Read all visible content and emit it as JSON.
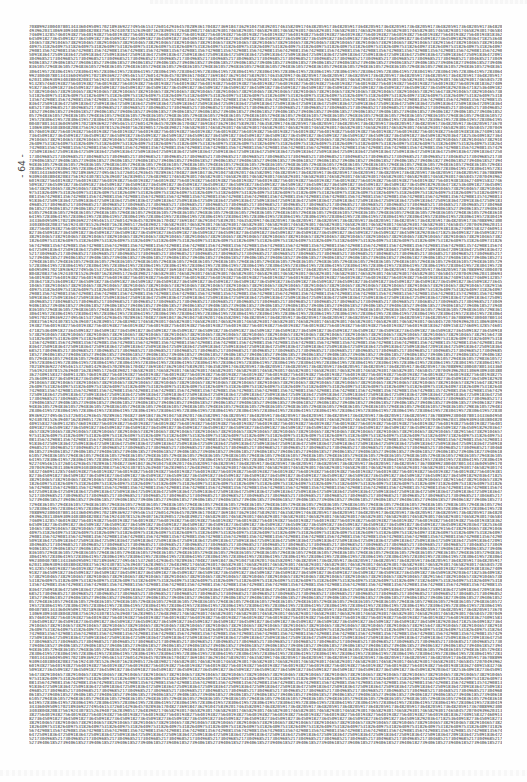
{
  "page": {
    "page_number": "- 64 -",
    "line_count": 178,
    "row_pool": [
      "708899230040780134336049509170218936922749546153726014293645702893617048273691847362910475839201746358209174638205917364820591736482059173648205917364820591736482059173648205917364820591736",
      "457207049396203130693093403804820837561924307815263940716283905172648390217465829301746582930174658293017465829301746582930174658293017465829301746582930174658293017465829301746582930174658",
      "183627409158327460913285746019382756401938275640193827564019382756401938275640193827564019382756401938275640193827564019382756401938275640193827564019382756401938275640193827564019382756401938",
      "920364718253640918273645091827364509182736450918273645091827364509182736450918273645091827364509182736450918273645091827364509182736450918273645091827364509182736450918273645091827364509182",
      "564738291046573829104657382910465738291046573829104657382910465738291046573829104657382910465738291046573829104657382910465738291046573829104657382910465738291046573829104657382910465738291",
      "318264097531826409753182640975318264097531826409753182640975318264097531826409753182640975318264097531826409753182640975318264097531826409753182640975318264097531826409753182640975318264097",
      "742908135674290813567429081356742908135674290813567429081356742908135674290813567429081356742908135674290813567429081356742908135674290813567429081356742908135674290813567429081356742908135",
      "091836472509183647250918364725091836472509183647250918364725091836472509183647250918364725091836472509183647250918364725091836472509183647250918364725091836472509183647250918364725091836472",
      "685217304968521730496852173049685217304968521730496852173049685217304968521730496852173049685217304968521730496852173049685217304968521730496852173049685217304968521730496852173049685217304",
      "273940618527394061852739406185273940618527394061852739406185273940618527394061852739406185273940618527394061852739406185273940618527394061852739406185273940618527394061852739406185273940618",
      "836105729483610572948361057294836105729483610572948361057294836105729483610572948361057294836105729483610572948361057294836105729483610572948361057294836105729483610572948361057294836105729",
      "419572830641957283064195728306419572830641957283064195728306419572830641957283064195728306419572830641957283064195728306419572830641957283064195728306419572830641957283064195728306419572830"
    ]
  }
}
